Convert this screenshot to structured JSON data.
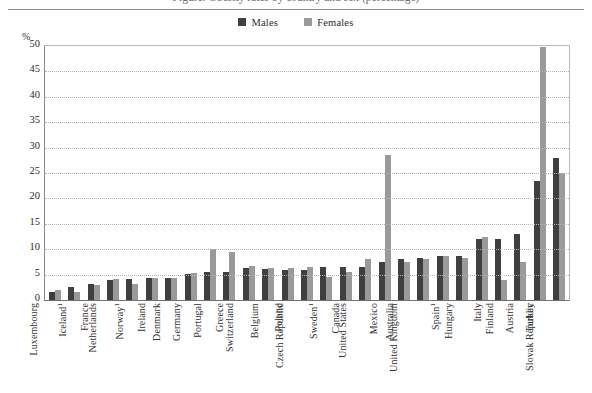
{
  "figure": {
    "title_clipped": "Figure: Obesity rates by country and sex (percentage)",
    "percent_symbol": "%",
    "legend_position": "top-center"
  },
  "legend": {
    "items": [
      {
        "label": "Males",
        "color": "#3f3f3f",
        "swatch_name": "males-swatch"
      },
      {
        "label": "Females",
        "color": "#9a9a9a",
        "swatch_name": "females-swatch"
      }
    ]
  },
  "axes": {
    "y_ticks": [
      "50",
      "45",
      "40",
      "35",
      "30",
      "25",
      "20",
      "15",
      "10",
      "5",
      "0"
    ],
    "y_unit": "%",
    "y_min": 0,
    "y_max": 50,
    "y_step": 5,
    "grid": true
  },
  "chart_data": {
    "type": "bar",
    "title": "Figure: Obesity rates by country and sex (percentage)",
    "xlabel": "",
    "ylabel": "%",
    "ylim": [
      0,
      50
    ],
    "ystep": 5,
    "grid": true,
    "legend_position": "top-center",
    "categories": [
      "Luxembourg",
      "Iceland¹",
      "France",
      "Netherlands",
      "Norway¹",
      "Ireland",
      "Denmark",
      "Germany",
      "Portugal",
      "Greece",
      "Switzerland",
      "Belgium",
      "Poland",
      "Czech Republic",
      "Sweden¹",
      "Canada",
      "United States",
      "Mexico",
      "Australia",
      "United Kingdom",
      "Spain¹",
      "Hungary",
      "Italy",
      "Finland",
      "Austria",
      "Turkey",
      "Slovak Republic"
    ],
    "category_footnotes": {
      "Iceland¹": "1",
      "Norway¹": "1",
      "Sweden¹": "1",
      "Spain¹": "1"
    },
    "series": [
      {
        "name": "Males",
        "color": "#3f3f3f",
        "values": [
          1.6,
          2.6,
          3.2,
          4.0,
          4.2,
          4.3,
          4.4,
          5.2,
          5.5,
          5.5,
          6.3,
          6.2,
          6.0,
          6.0,
          6.5,
          6.5,
          6.5,
          7.5,
          8.0,
          8.3,
          8.7,
          8.6,
          12.0,
          12.0,
          13.0,
          23.5,
          28.0
        ]
      },
      {
        "name": "Females",
        "color": "#9a9a9a",
        "values": [
          2.0,
          1.6,
          3.0,
          4.1,
          3.2,
          4.4,
          4.3,
          5.4,
          10.0,
          9.5,
          6.6,
          6.3,
          6.3,
          6.5,
          4.5,
          5.5,
          8.0,
          28.5,
          7.5,
          8.0,
          8.6,
          8.2,
          12.5,
          4.0,
          7.5,
          49.8,
          25.0
        ]
      }
    ]
  }
}
